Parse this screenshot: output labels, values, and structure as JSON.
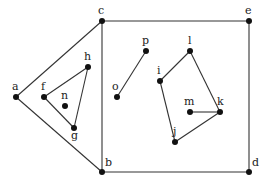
{
  "diagram": {
    "type": "graph",
    "colors": {
      "edge": "#333333",
      "node": "#111111",
      "label": "#222222",
      "background": "#ffffff"
    },
    "nodes": [
      {
        "id": "a",
        "label": "a",
        "x": 16,
        "y": 97,
        "lx": 12,
        "ly": 90
      },
      {
        "id": "b",
        "label": "b",
        "x": 102,
        "y": 172,
        "lx": 105,
        "ly": 166
      },
      {
        "id": "c",
        "label": "c",
        "x": 102,
        "y": 21,
        "lx": 98,
        "ly": 14
      },
      {
        "id": "d",
        "label": "d",
        "x": 249,
        "y": 172,
        "lx": 252,
        "ly": 166
      },
      {
        "id": "e",
        "label": "e",
        "x": 249,
        "y": 21,
        "lx": 245,
        "ly": 14
      },
      {
        "id": "f",
        "label": "f",
        "x": 44,
        "y": 97,
        "lx": 41,
        "ly": 90
      },
      {
        "id": "g",
        "label": "g",
        "x": 74,
        "y": 128,
        "lx": 71,
        "ly": 139
      },
      {
        "id": "h",
        "label": "h",
        "x": 88,
        "y": 67,
        "lx": 84,
        "ly": 60
      },
      {
        "id": "i",
        "label": "i",
        "x": 160,
        "y": 81,
        "lx": 157,
        "ly": 74
      },
      {
        "id": "j",
        "label": "j",
        "x": 175,
        "y": 142,
        "lx": 173,
        "ly": 135
      },
      {
        "id": "k",
        "label": "k",
        "x": 220,
        "y": 112,
        "lx": 217,
        "ly": 105
      },
      {
        "id": "l",
        "label": "l",
        "x": 190,
        "y": 51,
        "lx": 188,
        "ly": 44
      },
      {
        "id": "m",
        "label": "m",
        "x": 190,
        "y": 112,
        "lx": 184,
        "ly": 105
      },
      {
        "id": "n",
        "label": "n",
        "x": 65,
        "y": 106,
        "lx": 61,
        "ly": 99
      },
      {
        "id": "o",
        "label": "o",
        "x": 117,
        "y": 97,
        "lx": 112,
        "ly": 90
      },
      {
        "id": "p",
        "label": "p",
        "x": 146,
        "y": 51,
        "lx": 142,
        "ly": 44
      }
    ],
    "edges": [
      [
        "a",
        "c"
      ],
      [
        "a",
        "b"
      ],
      [
        "c",
        "b"
      ],
      [
        "c",
        "e"
      ],
      [
        "e",
        "d"
      ],
      [
        "b",
        "d"
      ],
      [
        "f",
        "h"
      ],
      [
        "h",
        "g"
      ],
      [
        "f",
        "g"
      ],
      [
        "o",
        "p"
      ],
      [
        "i",
        "l"
      ],
      [
        "l",
        "k"
      ],
      [
        "k",
        "j"
      ],
      [
        "j",
        "i"
      ],
      [
        "m",
        "k"
      ]
    ]
  }
}
